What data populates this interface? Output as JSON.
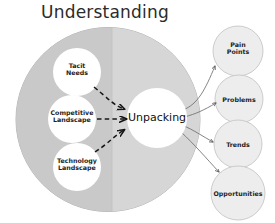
{
  "diagram": {
    "title": "Understanding",
    "container": {
      "name": "understanding-sphere",
      "fill_left": "#c9c9c9",
      "fill_right": "#d5d5d5",
      "stroke": "#b0b0b0"
    },
    "inputs": [
      {
        "id": "tacit-needs",
        "label_line1": "Tacit",
        "label_line2": "Needs",
        "cx": 77,
        "cy": 72,
        "r": 24
      },
      {
        "id": "competitive-landscape",
        "label_line1": "Competitive",
        "label_line2": "Landscape",
        "cx": 72,
        "cy": 119,
        "r": 24
      },
      {
        "id": "technology-landscape",
        "label_line1": "Technology",
        "label_line2": "Landscape",
        "cx": 77,
        "cy": 167,
        "r": 24
      }
    ],
    "center": {
      "id": "unpacking",
      "label": "Unpacking",
      "cx": 157,
      "cy": 118,
      "r": 30,
      "fill": "#ffffff"
    },
    "outputs": [
      {
        "id": "pain-points",
        "label_line1": "Pain",
        "label_line2": "Points",
        "cx": 238,
        "cy": 51,
        "r": 25
      },
      {
        "id": "problems",
        "label_line1": "Problems",
        "label_line2": "",
        "cx": 239,
        "cy": 99,
        "r": 24
      },
      {
        "id": "trends",
        "label_line1": "Trends",
        "label_line2": "",
        "cx": 238,
        "cy": 144,
        "r": 24
      },
      {
        "id": "opportunities",
        "label_line1": "Opportunities",
        "label_line2": "",
        "cx": 238,
        "cy": 193,
        "r": 27
      }
    ],
    "connectors": {
      "inbound_style": "dashed-arrow",
      "inbound_color": "#1a1a1a",
      "outbound_style": "solid-arrow",
      "outbound_color": "#6b6b6b",
      "inbound_count": 3,
      "outbound_count": 4
    },
    "colors": {
      "node_fill": "#ffffff",
      "output_fill": "#ededed",
      "output_stroke": "#c6c6c6",
      "text": "#1d1d1d",
      "title": "#2b2b2b"
    }
  }
}
